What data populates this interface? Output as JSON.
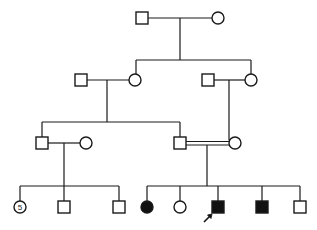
{
  "diagram": {
    "type": "pedigree",
    "colors": {
      "line": "#1a1a1a",
      "affected": "#111111",
      "unaffected": "#ffffff"
    },
    "generations": [
      {
        "id": "I",
        "individuals": [
          {
            "id": "I-1",
            "sex": "male",
            "affected": false
          },
          {
            "id": "I-2",
            "sex": "female",
            "affected": false
          }
        ]
      },
      {
        "id": "II",
        "individuals": [
          {
            "id": "II-1",
            "sex": "male",
            "affected": false,
            "note": "spouse"
          },
          {
            "id": "II-2",
            "sex": "female",
            "affected": false
          },
          {
            "id": "II-3",
            "sex": "male",
            "affected": false,
            "note": "spouse"
          },
          {
            "id": "II-4",
            "sex": "female",
            "affected": false
          }
        ]
      },
      {
        "id": "III",
        "individuals": [
          {
            "id": "III-1",
            "sex": "male",
            "affected": false
          },
          {
            "id": "III-2",
            "sex": "female",
            "affected": false,
            "note": "spouse"
          },
          {
            "id": "III-3",
            "sex": "male",
            "affected": false
          },
          {
            "id": "III-4",
            "sex": "female",
            "affected": false
          }
        ],
        "consanguineous_union": [
          "III-3",
          "III-4"
        ]
      },
      {
        "id": "IV",
        "individuals": [
          {
            "id": "IV-1",
            "sex": "female",
            "affected": false,
            "count_label": "5"
          },
          {
            "id": "IV-2",
            "sex": "male",
            "affected": false
          },
          {
            "id": "IV-3",
            "sex": "male",
            "affected": false
          },
          {
            "id": "IV-4",
            "sex": "female",
            "affected": true
          },
          {
            "id": "IV-5",
            "sex": "female",
            "affected": false
          },
          {
            "id": "IV-6",
            "sex": "male",
            "affected": true,
            "proband": true
          },
          {
            "id": "IV-7",
            "sex": "male",
            "affected": true
          },
          {
            "id": "IV-8",
            "sex": "male",
            "affected": false
          }
        ]
      }
    ],
    "labels": {
      "multiple_count": "5"
    },
    "proband_marker": "arrow"
  }
}
